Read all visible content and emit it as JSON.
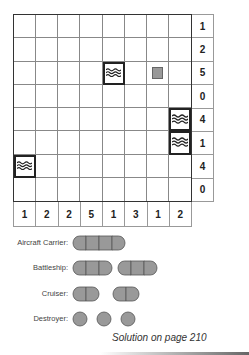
{
  "puzzle": {
    "rows": 8,
    "cols": 8,
    "row_clues": [
      "1",
      "2",
      "5",
      "0",
      "4",
      "1",
      "4",
      "0"
    ],
    "col_clues": [
      "1",
      "2",
      "2",
      "5",
      "1",
      "3",
      "1",
      "2"
    ],
    "given_cells": [
      {
        "row": 2,
        "col": 4,
        "type": "water",
        "icon": "water-waves-icon"
      },
      {
        "row": 2,
        "col": 6,
        "type": "ship-segment",
        "icon": "ship-square-icon"
      },
      {
        "row": 4,
        "col": 7,
        "type": "water",
        "icon": "water-waves-icon"
      },
      {
        "row": 5,
        "col": 7,
        "type": "water",
        "icon": "water-waves-icon"
      },
      {
        "row": 6,
        "col": 0,
        "type": "water",
        "icon": "water-waves-icon"
      }
    ]
  },
  "fleet": [
    {
      "label": "Aircraft Carrier:",
      "count": 1,
      "length": 4
    },
    {
      "label": "Battleship:",
      "count": 2,
      "length": 3
    },
    {
      "label": "Cruiser:",
      "count": 2,
      "length": 2
    },
    {
      "label": "Destroyer:",
      "count": 3,
      "length": 1
    }
  ],
  "footer": {
    "solution_text": "Solution on page 210"
  },
  "colors": {
    "ship_fill": "#999999",
    "ship_stroke": "#555555",
    "grid_line": "#888888",
    "grid_border": "#333333"
  }
}
